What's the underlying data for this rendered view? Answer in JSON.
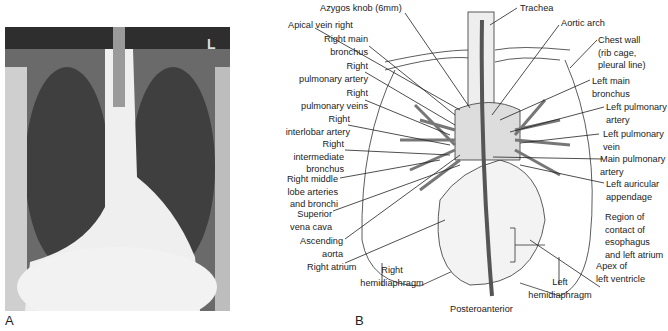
{
  "panels": {
    "a": {
      "label": "A",
      "description": "Posteroanterior chest radiograph",
      "marker": "L"
    },
    "b": {
      "label": "B",
      "caption": "Posteroanterior"
    }
  },
  "labels_left": [
    {
      "id": "azygos",
      "text": "Azygos knob (6mm)"
    },
    {
      "id": "apical-vein",
      "text": "Apical vein right"
    },
    {
      "id": "right-main-bronchus",
      "lines": [
        "Right main",
        "bronchus"
      ]
    },
    {
      "id": "right-pulmonary-artery",
      "lines": [
        "Right",
        "pulmonary artery"
      ]
    },
    {
      "id": "right-pulmonary-veins",
      "lines": [
        "Right",
        "pulmonary veins"
      ]
    },
    {
      "id": "right-interlobar-artery",
      "lines": [
        "Right",
        "interlobar artery"
      ]
    },
    {
      "id": "right-intermediate-bronchus",
      "lines": [
        "Right",
        "intermediate",
        "bronchus"
      ]
    },
    {
      "id": "right-middle-lobe",
      "lines": [
        "Right middle",
        "lobe arteries",
        "and bronchi"
      ]
    },
    {
      "id": "svc",
      "lines": [
        "Superior",
        "vena cava"
      ]
    },
    {
      "id": "ascending-aorta",
      "lines": [
        "Ascending",
        "aorta"
      ]
    },
    {
      "id": "right-atrium",
      "text": "Right atrium"
    },
    {
      "id": "right-hemidiaphragm",
      "lines": [
        "Right",
        "hemidiaphragm"
      ]
    }
  ],
  "labels_right": [
    {
      "id": "trachea",
      "text": "Trachea"
    },
    {
      "id": "aortic-arch",
      "text": "Aortic arch"
    },
    {
      "id": "chest-wall",
      "lines": [
        "Chest wall",
        "(rib cage,",
        "pleural line)"
      ]
    },
    {
      "id": "left-main-bronchus",
      "lines": [
        "Left main",
        "bronchus"
      ]
    },
    {
      "id": "left-pulmonary-artery",
      "lines": [
        "Left pulmonary",
        "artery"
      ]
    },
    {
      "id": "left-pulmonary-vein",
      "lines": [
        "Left pulmonary",
        "vein"
      ]
    },
    {
      "id": "main-pulmonary-artery",
      "lines": [
        "Main pulmonary",
        "artery"
      ]
    },
    {
      "id": "left-auricular-appendage",
      "lines": [
        "Left auricular",
        "appendage"
      ]
    },
    {
      "id": "region-contact",
      "lines": [
        "Region of",
        "contact of",
        "esophagus",
        "and left atrium"
      ]
    },
    {
      "id": "apex-lv",
      "lines": [
        "Apex of",
        "left ventricle"
      ]
    },
    {
      "id": "left-hemidiaphragm",
      "lines": [
        "Left",
        "hemidiaphragm"
      ]
    }
  ]
}
